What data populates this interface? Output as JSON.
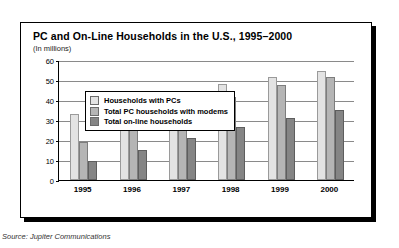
{
  "chart_data": {
    "type": "bar",
    "title": "PC and On-Line Households in the U.S., 1995–2000",
    "subtitle": "(In millions)",
    "xlabel": "",
    "ylabel": "",
    "ylim": [
      0,
      60
    ],
    "ytick_step": 10,
    "yticks": [
      "0",
      "10",
      "20",
      "30",
      "40",
      "50",
      "60"
    ],
    "grid": true,
    "legend_position": "top-left-inside",
    "categories": [
      "1995",
      "1996",
      "1997",
      "1998",
      "1999",
      "2000"
    ],
    "series": [
      {
        "name": "Households with PCs",
        "color": "#e3e3e3",
        "values": [
          33,
          38,
          43.5,
          48,
          51.5,
          54.5
        ]
      },
      {
        "name": "Total PC households with modems",
        "color": "#b5b5b5",
        "values": [
          19,
          27,
          34.5,
          41.5,
          47.5,
          51.5
        ]
      },
      {
        "name": "Total on-line households",
        "color": "#858585",
        "values": [
          9.5,
          15,
          21,
          26.5,
          31,
          35
        ]
      }
    ],
    "source": "Source: Jupiter Communications"
  },
  "colors": {
    "series_light": "#e3e3e3",
    "series_medium": "#b5b5b5",
    "series_dark": "#858585",
    "frame": "#000000",
    "gridline": "#8a8a8a"
  }
}
